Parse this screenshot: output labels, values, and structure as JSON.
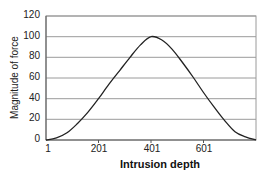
{
  "chart_data": {
    "type": "line",
    "title": "",
    "xlabel": "Intrusion depth",
    "ylabel": "Magnitude of force",
    "ylim": [
      0,
      120
    ],
    "xlim": [
      1,
      801
    ],
    "yticks": [
      "0",
      "20",
      "40",
      "60",
      "80",
      "100",
      "120"
    ],
    "xticks": [
      "1",
      "201",
      "401",
      "601"
    ],
    "grid": "horizontal",
    "legend": "none",
    "series": [
      {
        "name": "Magnitude of force",
        "x": [
          1,
          41,
          81,
          121,
          161,
          201,
          241,
          281,
          321,
          361,
          401,
          441,
          481,
          521,
          561,
          601,
          641,
          681,
          721,
          761,
          801
        ],
        "values": [
          0,
          2,
          7,
          16,
          27,
          40,
          54,
          67,
          80,
          92,
          100,
          97,
          88,
          75,
          61,
          46,
          32,
          19,
          8,
          3,
          0
        ]
      }
    ]
  }
}
